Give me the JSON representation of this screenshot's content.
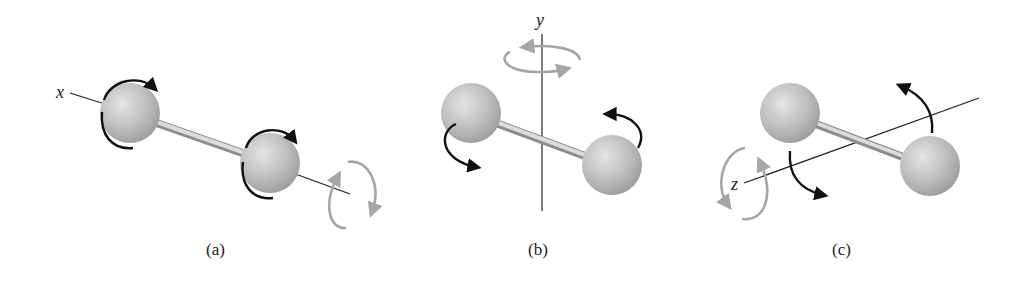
{
  "figure": {
    "panels": [
      {
        "id": "a",
        "caption": "(a)",
        "axis_label": "x",
        "description": "Diatomic molecule rotating about x axis (along the bond)"
      },
      {
        "id": "b",
        "caption": "(b)",
        "axis_label": "y",
        "description": "Diatomic molecule rotating about vertical y axis"
      },
      {
        "id": "c",
        "caption": "(c)",
        "axis_label": "z",
        "description": "Diatomic molecule rotating about z axis"
      }
    ],
    "colors": {
      "atom": "#b9b9b9",
      "atom_highlight": "#e2e2e2",
      "bond": "#c4c4c4",
      "arrow_dark": "#111111",
      "arrow_light": "#a6a6a6",
      "axis": "#222222"
    }
  }
}
